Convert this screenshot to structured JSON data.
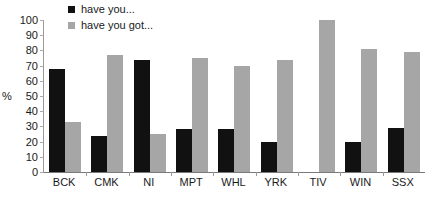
{
  "chart_data": {
    "type": "bar",
    "title": "",
    "xlabel": "",
    "ylabel": "%",
    "ylim": [
      0,
      100
    ],
    "yticks": [
      0,
      10,
      20,
      30,
      40,
      50,
      60,
      70,
      80,
      90,
      100
    ],
    "grid": false,
    "legend_position": "top-center",
    "categories": [
      "BCK",
      "CMK",
      "NI",
      "MPT",
      "WHL",
      "YRK",
      "TIV",
      "WIN",
      "SSX"
    ],
    "series": [
      {
        "name": "have you...",
        "color": "#111111",
        "values": [
          68,
          24,
          74,
          28,
          28,
          20,
          0,
          20,
          29
        ]
      },
      {
        "name": "have you got...",
        "color": "#a6a6a6",
        "values": [
          33,
          77,
          25,
          75,
          70,
          74,
          100,
          81,
          79
        ]
      }
    ]
  },
  "colors": {
    "series_0": "#111111",
    "series_1": "#a6a6a6",
    "axis": "#7a7a7a",
    "tick": "#a8a8a8",
    "text": "#1a1a1a",
    "background": "#ffffff"
  }
}
